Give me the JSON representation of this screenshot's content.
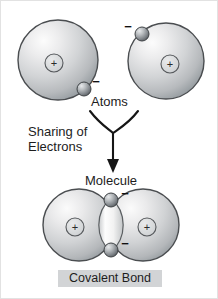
{
  "figure": {
    "title_text": "Covalent Bond",
    "background_color": "#ffffff",
    "labels": {
      "atoms": "Atoms",
      "sharing_line1": "Sharing of",
      "sharing_line2": "Electrons",
      "molecule": "Molecule",
      "covalent_bond": "Covalent Bond"
    },
    "charge_signs": {
      "positive": "+",
      "negative": "−"
    },
    "colors": {
      "sphere_light": "#f4f4f4",
      "sphere_mid": "#c9cbcd",
      "sphere_dark": "#8f9397",
      "outline": "#4a4d50",
      "electron_light": "#c7c9cb",
      "electron_dark": "#5d6164",
      "lens_light": "#fbfbfb",
      "lens_mid": "#dcdee0",
      "text": "#1d1d1d",
      "caption_band": "#d2d4d6",
      "arrow": "#161616"
    },
    "atoms": [
      {
        "name": "atom-left",
        "cx": 57,
        "cy": 59,
        "r": 40,
        "nucleus_sign": "+",
        "electron": {
          "cx": 83,
          "cy": 88,
          "r": 7,
          "sign": "−",
          "sign_x": 95,
          "sign_y": 84
        }
      },
      {
        "name": "atom-right",
        "cx": 165,
        "cy": 60,
        "r": 38,
        "nucleus_sign": "+",
        "electron": {
          "cx": 141,
          "cy": 33,
          "r": 7,
          "sign": "−",
          "sign_x": 125,
          "sign_y": 29
        }
      }
    ],
    "molecule": {
      "left_circle": {
        "cx": 78,
        "cy": 224,
        "r": 36,
        "nucleus_sign": "+"
      },
      "right_circle": {
        "cx": 142,
        "cy": 224,
        "r": 36,
        "nucleus_sign": "+"
      },
      "shared_electrons": [
        {
          "cx": 110,
          "cy": 199,
          "r": 7,
          "sign": "−",
          "sign_x": 122,
          "sign_y": 196
        },
        {
          "cx": 110,
          "cy": 249,
          "r": 7,
          "sign": "−",
          "sign_x": 122,
          "sign_y": 246
        }
      ]
    },
    "brace": {
      "description": "y-shaped brace joining the two atoms into a downward arrow"
    }
  }
}
